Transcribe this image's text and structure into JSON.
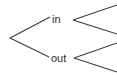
{
  "diagram": {
    "type": "binary-branching-tree",
    "canvas": {
      "width": 117,
      "height": 75,
      "background": "#ffffff"
    },
    "stroke_color": "#3a3a3a",
    "text_color": "#2b2b2b",
    "root": {
      "name": "root-vertex",
      "x": 10,
      "y": 38,
      "label": ""
    },
    "nodes": [
      {
        "name": "node-in",
        "label": "in",
        "text_x": 52,
        "text_y": 23,
        "branch_from": {
          "x": 10,
          "y": 38
        },
        "branch_to": {
          "x": 50,
          "y": 17
        }
      },
      {
        "name": "node-out",
        "label": "out",
        "text_x": 51,
        "text_y": 62,
        "branch_from": {
          "x": 10,
          "y": 38
        },
        "branch_to": {
          "x": 49,
          "y": 57
        }
      }
    ],
    "sub_brackets": [
      {
        "name": "bracket-in",
        "parent": "in",
        "vertex": {
          "x": 73,
          "y": 20
        },
        "upper_end": {
          "x": 117,
          "y": 5
        },
        "lower_end": {
          "x": 117,
          "y": 34
        }
      },
      {
        "name": "bracket-out",
        "parent": "out",
        "vertex": {
          "x": 74,
          "y": 58
        },
        "upper_end": {
          "x": 117,
          "y": 43
        },
        "lower_end": {
          "x": 117,
          "y": 72
        }
      }
    ]
  }
}
